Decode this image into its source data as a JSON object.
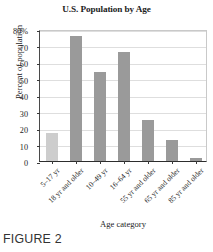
{
  "chart_data": {
    "type": "bar",
    "title": "U.S. Population by Age",
    "xlabel": "Age category",
    "ylabel": "Percent of population",
    "categories": [
      "5–17 yr",
      "18 yr and older",
      "10–49 yr",
      "16–64 yr",
      "55 yr and older",
      "65 yr and older",
      "85 yr and older"
    ],
    "values": [
      17,
      76,
      54,
      66,
      25,
      13,
      2
    ],
    "bar_colors": [
      "#cdcdcd",
      "#9a9a9a",
      "#9a9a9a",
      "#9a9a9a",
      "#9a9a9a",
      "#9a9a9a",
      "#9a9a9a"
    ],
    "ylim": [
      0,
      80
    ],
    "ytick_values": [
      0,
      10,
      20,
      30,
      40,
      50,
      60,
      70,
      80
    ],
    "ytick_labels": [
      "0",
      "10",
      "20",
      "30",
      "40",
      "50",
      "60",
      "70",
      "80%"
    ],
    "grid": true,
    "legend": null,
    "legend_position": "none"
  },
  "caption": {
    "label": "FIGURE 2"
  },
  "colors": {
    "bar_primary": "#9a9a9a",
    "bar_highlight": "#cdcdcd",
    "grid": "#dedede",
    "axis": "#2d2d2d",
    "text": "#1d1d1d"
  }
}
